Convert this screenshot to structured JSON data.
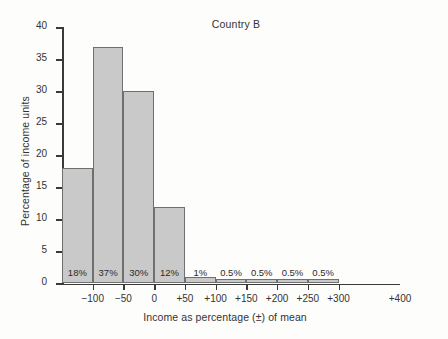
{
  "chart_data": {
    "type": "bar",
    "title": "Country B",
    "xlabel": "Income as percentage (±) of mean",
    "ylabel": "Percentage of income units",
    "grid": false,
    "legend": "none",
    "ylim": [
      0,
      40
    ],
    "ytick_labels": [
      "0",
      "5",
      "10",
      "15",
      "20",
      "25",
      "30",
      "35",
      "40"
    ],
    "ytick_values": [
      0,
      5,
      10,
      15,
      20,
      25,
      30,
      35,
      40
    ],
    "xtick_labels": [
      "−100",
      "−50",
      "0",
      "+50",
      "+100",
      "+150",
      "+200",
      "+250",
      "+300",
      "+400"
    ],
    "xtick_values": [
      -100,
      -50,
      0,
      50,
      100,
      150,
      200,
      250,
      300,
      400
    ],
    "bin_edges": [
      -150,
      -100,
      -50,
      0,
      50,
      100,
      150,
      200,
      250,
      300
    ],
    "categories": [
      "−150 to −100",
      "−100 to −50",
      "−50 to 0",
      "0 to +50",
      "+50 to +100",
      "+100 to +150",
      "+150 to +200",
      "+200 to +250",
      "+250 to +300"
    ],
    "values": [
      18,
      37,
      30,
      12,
      1,
      0.5,
      0.5,
      0.5,
      0.5
    ],
    "data_labels": [
      "18%",
      "37%",
      "30%",
      "12%",
      "1%",
      "0.5%",
      "0.5%",
      "0.5%",
      "0.5%"
    ]
  },
  "colors": {
    "bar_fill": "#c9c9c9",
    "bar_stroke": "#6f6f6f",
    "axis": "#3a3a3a",
    "text": "#2b2b2b",
    "background": "#fdfdfc"
  }
}
